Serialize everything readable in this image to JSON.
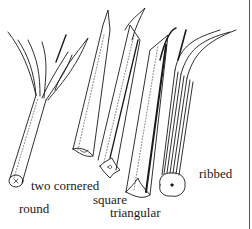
{
  "figure": {
    "line_color": "#1a1a1a",
    "background": "#ffffff",
    "labels": [
      {
        "id": "round",
        "text": "round"
      },
      {
        "id": "two_cornered",
        "text": "two cornered"
      },
      {
        "id": "square",
        "text": "square"
      },
      {
        "id": "triangular",
        "text": "triangular"
      },
      {
        "id": "ribbed",
        "text": "ribbed"
      }
    ]
  }
}
